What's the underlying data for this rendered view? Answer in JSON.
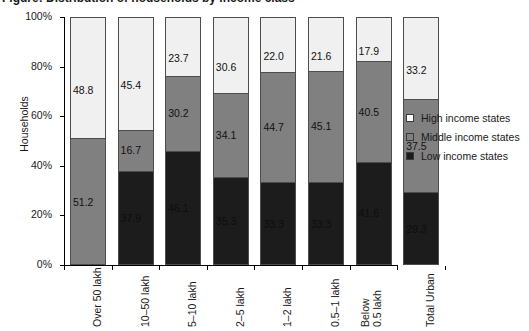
{
  "title": {
    "text": "Figure: Distribution of households by income class"
  },
  "chart_data": {
    "type": "bar",
    "subtype": "stacked-100-percent",
    "title": "",
    "xlabel": "",
    "ylabel": "Households",
    "ylim": [
      0,
      100
    ],
    "ytick_labels": [
      "0%",
      "20%",
      "40%",
      "60%",
      "80%",
      "100%"
    ],
    "ytick_values": [
      0,
      20,
      40,
      60,
      80,
      100
    ],
    "grid": false,
    "legend_position": "right",
    "stack_order_bottom_to_top": [
      "Low income states",
      "Middle income states",
      "High income states"
    ],
    "categories": [
      "Over 50 lakh",
      "10–50 lakh",
      "5–10 lakh",
      "2–5 lakh",
      "1–2 lakh",
      "0.5–1 lakh",
      "Below\n0.5 lakh",
      "Total Urban"
    ],
    "series": [
      {
        "name": "High income states",
        "color": "#f0f0f0",
        "values": [
          48.8,
          45.4,
          23.7,
          30.6,
          22.0,
          21.6,
          17.9,
          33.2
        ]
      },
      {
        "name": "Middle income states",
        "color": "#808080",
        "values": [
          51.2,
          16.7,
          30.2,
          34.1,
          44.7,
          45.1,
          40.5,
          37.5
        ]
      },
      {
        "name": "Low income states",
        "color": "#1c1c1c",
        "values": [
          0.0,
          37.9,
          46.1,
          35.3,
          33.3,
          33.3,
          41.6,
          29.3
        ]
      }
    ],
    "bar_labels": {
      "high": [
        "48.8",
        "45.4",
        "23.7",
        "30.6",
        "22.0",
        "21.6",
        "17.9",
        "33.2"
      ],
      "middle": [
        "51.2",
        "16.7",
        "30.2",
        "34.1",
        "44.7",
        "45.1",
        "40.5",
        "37.5"
      ],
      "low": [
        "",
        "37.9",
        "46.1",
        "35.3",
        "33.3",
        "33.3",
        "41.6",
        "29.3"
      ]
    }
  },
  "legend": {
    "items": [
      {
        "label": "High income states",
        "swatch": "high"
      },
      {
        "label": "Middle income states",
        "swatch": "middle"
      },
      {
        "label": "Low income states",
        "swatch": "low"
      }
    ]
  },
  "colors": {
    "high_income": "#f0f0f0",
    "middle_income": "#808080",
    "low_income": "#1c1c1c",
    "axis": "#000000",
    "text": "#1a1a1a"
  }
}
